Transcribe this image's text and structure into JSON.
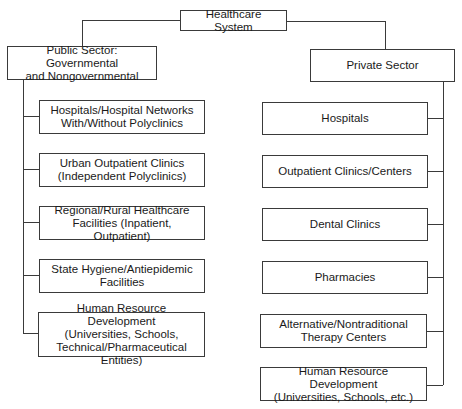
{
  "diagram": {
    "type": "org-chart",
    "root": {
      "label": "Healthcare System"
    },
    "branches": [
      {
        "label": "Public Sector: Governmental\nand Nongovernmental",
        "children": [
          {
            "label": "Hospitals/Hospital Networks\nWith/Without Polyclinics"
          },
          {
            "label": "Urban Outpatient Clinics\n(Independent Polyclinics)"
          },
          {
            "label": "Regional/Rural Healthcare\nFacilities (Inpatient, Outpatient)"
          },
          {
            "label": "State Hygiene/Antiepidemic\nFacilities"
          },
          {
            "label": "Human Resource Development\n(Universities, Schools,\nTechnical/Pharmaceutical Entities)"
          }
        ]
      },
      {
        "label": "Private Sector",
        "children": [
          {
            "label": "Hospitals"
          },
          {
            "label": "Outpatient Clinics/Centers"
          },
          {
            "label": "Dental Clinics"
          },
          {
            "label": "Pharmacies"
          },
          {
            "label": "Alternative/Nontraditional\nTherapy Centers"
          },
          {
            "label": "Human Resource Development\n(Universities, Schools, etc.)"
          }
        ]
      }
    ]
  },
  "colors": {
    "line": "#3a3a3a",
    "box_border": "#3a3a3a",
    "text": "#1a1a1a",
    "background": "#ffffff"
  }
}
